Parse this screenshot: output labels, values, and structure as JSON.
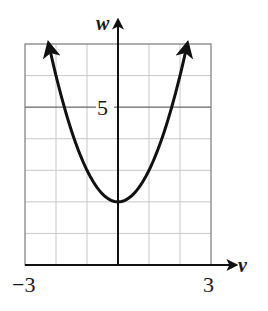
{
  "chart_data": {
    "type": "line",
    "title": "",
    "xlabel": "v",
    "ylabel": "w",
    "xlim": [
      -3,
      3
    ],
    "ylim": [
      0,
      7
    ],
    "grid": true,
    "x_ticks_labeled": [
      "-3",
      "3"
    ],
    "y_ticks_labeled": [
      "5"
    ],
    "grid_step": 1,
    "series": [
      {
        "name": "w = v^2 + 2",
        "equation": "w = v^2 + 2",
        "x": [
          -2.24,
          -2,
          -1.5,
          -1,
          -0.5,
          0,
          0.5,
          1,
          1.5,
          2,
          2.24
        ],
        "values": [
          7.0,
          6,
          4.25,
          3,
          2.25,
          2,
          2.25,
          3,
          4.25,
          6,
          7.0
        ],
        "arrows_at_ends": true
      }
    ],
    "vertex": [
      0,
      2
    ]
  },
  "labels": {
    "x_axis": "v",
    "y_axis": "w",
    "x_min": "−3",
    "x_max": "3",
    "y_tick": "5"
  },
  "colors": {
    "curve": "#111111",
    "grid": "#c8c8c8",
    "frame": "#7a7a7a",
    "axis": "#111111"
  }
}
